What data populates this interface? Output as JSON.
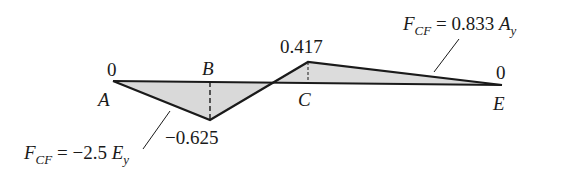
{
  "diagram": {
    "type": "influence-line",
    "points": [
      {
        "name": "A",
        "value_label": "0",
        "value": 0
      },
      {
        "name": "B",
        "value_label": "-0.625",
        "value": -0.625
      },
      {
        "name": "C",
        "value_label": "0.417",
        "value": 0.417
      },
      {
        "name": "E",
        "value_label": "0",
        "value": 0
      }
    ],
    "annotations": {
      "left_formula": {
        "lhs": "F",
        "sub": "CF",
        "eq": "= −2.5",
        "var": "E",
        "var_sub": "y"
      },
      "right_formula": {
        "lhs": "F",
        "sub": "CF",
        "eq": "= 0.833",
        "var": "A",
        "var_sub": "y"
      }
    },
    "labels": {
      "a_value": "0",
      "a_name": "A",
      "b_name": "B",
      "b_value": "−0.625",
      "c_value": "0.417",
      "c_name": "C",
      "e_value": "0",
      "e_name": "E"
    },
    "colors": {
      "line": "#1a1a1a",
      "fill": "#d9d9d9"
    }
  }
}
